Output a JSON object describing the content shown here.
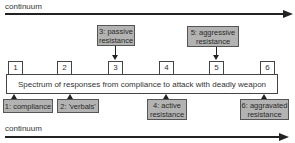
{
  "diagram": {
    "top_axis": {
      "label": "continuum"
    },
    "bottom_axis": {
      "label": "continuum"
    },
    "spectrum": {
      "text": "Spectrum of responses from compliance to attack with deadly weapon",
      "markers": [
        "1",
        "2",
        "3",
        "4",
        "5",
        "6"
      ]
    },
    "stages_above": [
      {
        "marker": "3",
        "text": "3: passive\nresistance"
      },
      {
        "marker": "5",
        "text": "5: aggressive\nresistance"
      }
    ],
    "stages_below": [
      {
        "marker": "1",
        "text": "1: compliance"
      },
      {
        "marker": "2",
        "text": "2: 'verbals'"
      },
      {
        "marker": "4",
        "text": "4: active\nresistance"
      },
      {
        "marker": "6",
        "text": "6: aggravated\nresistance"
      }
    ],
    "colors": {
      "stage_box_fill": "#b3b3b3",
      "line": "#222222",
      "background": "#ffffff"
    }
  }
}
